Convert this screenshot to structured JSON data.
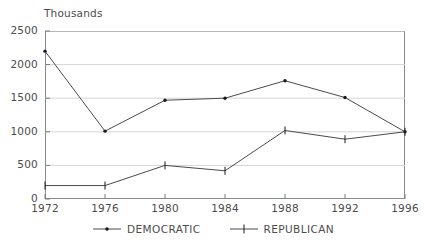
{
  "chart_data": {
    "type": "line",
    "title": "",
    "unit_caption": "Thousands",
    "xlabel": "",
    "ylabel": "Thousands",
    "categories": [
      "1972",
      "1976",
      "1980",
      "1984",
      "1988",
      "1992",
      "1996"
    ],
    "x": [
      1972,
      1976,
      1980,
      1984,
      1988,
      1992,
      1996
    ],
    "series": [
      {
        "name": "DEMOCRATIC",
        "marker": "dot",
        "color": "#4a4a4a",
        "values": [
          2200,
          1010,
          1470,
          1500,
          1760,
          1510,
          1000
        ]
      },
      {
        "name": "REPUBLICAN",
        "marker": "plus",
        "color": "#4a4a4a",
        "values": [
          200,
          200,
          500,
          420,
          1020,
          890,
          1000
        ]
      }
    ],
    "ylim": [
      0,
      2500
    ],
    "yticks": [
      0,
      500,
      1000,
      1500,
      2000,
      2500
    ],
    "ytick_labels": [
      "0",
      "500",
      "1000",
      "1500",
      "2000",
      "2500"
    ],
    "grid": true,
    "grid_axis": "y",
    "legend_position": "bottom-center"
  },
  "legend": {
    "entries": [
      {
        "label": "DEMOCRATIC",
        "marker": "dot"
      },
      {
        "label": "REPUBLICAN",
        "marker": "plus"
      }
    ]
  }
}
